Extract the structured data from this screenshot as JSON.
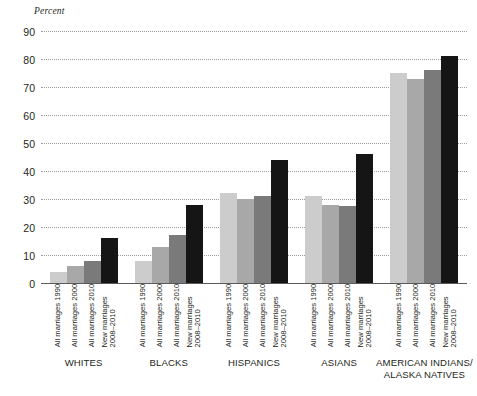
{
  "chart_data": {
    "type": "bar",
    "title": "",
    "xlabel": "",
    "ylabel": "Percent",
    "ylim": [
      0,
      90
    ],
    "ytick_step": 10,
    "yticks": [
      90,
      80,
      70,
      60,
      50,
      40,
      30,
      20,
      10,
      0
    ],
    "grid": true,
    "legend_position": "none",
    "categories": [
      "WHITES",
      "BLACKS",
      "HISPANICS",
      "ASIANS",
      "AMERICAN INDIANS/\nALASKA NATIVES"
    ],
    "series": [
      {
        "name": "All marriages 1990",
        "color": "#cccccc",
        "values": [
          4,
          8,
          32,
          31,
          75
        ]
      },
      {
        "name": "All marriages 2000",
        "color": "#a8a8a8",
        "values": [
          6,
          13,
          30,
          28,
          73
        ]
      },
      {
        "name": "All marriages 2010",
        "color": "#7a7a7a",
        "values": [
          8,
          17,
          31,
          27.5,
          76
        ]
      },
      {
        "name": "New marriages\n2008–2010",
        "color": "#151515",
        "values": [
          16,
          28,
          44,
          46,
          81
        ]
      }
    ]
  },
  "axis": {
    "y_title": "Percent"
  },
  "colors": {
    "gridline": "#9d9d9d",
    "baseline": "#5a5a5a",
    "text": "#231f20",
    "background": "#ffffff"
  }
}
